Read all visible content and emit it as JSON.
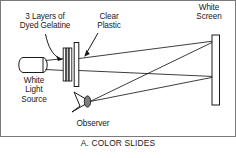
{
  "figure": {
    "caption": "A.  COLOR SLIDES",
    "border_color": "#6b6b6b",
    "stroke_color": "#1a1a1a",
    "text_color": "#1a1a1a",
    "background": "#ffffff"
  },
  "labels": {
    "gelatine": "3 Layers of\nDyed Gelatine",
    "plastic": "Clear\nPlastic",
    "screen": "White\nScreen",
    "source": "White\nLight\nSource",
    "observer": "Observer"
  },
  "parts": {
    "light_source_name": "white-light-source",
    "gelatine_layers_count": 3,
    "clear_plastic_name": "clear-plastic-sheet",
    "white_screen_name": "white-screen",
    "observer_name": "observer-eye"
  }
}
